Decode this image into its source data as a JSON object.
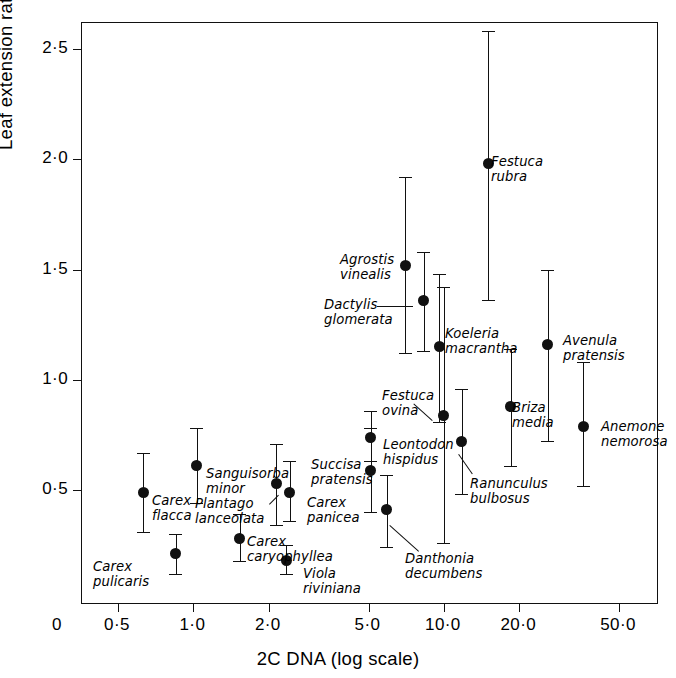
{
  "figure": {
    "x_axis_title": "2C DNA (log scale)",
    "y_axis_title_main": "Leaf extension rate (mm day",
    "y_axis_title_sup": "−1",
    "y_axis_title_tail": ")"
  },
  "chart_data": {
    "type": "scatter",
    "title": "",
    "xlabel": "2C DNA (log scale)",
    "ylabel": "Leaf extension rate (mm day⁻¹)",
    "x_scale": "log",
    "y_scale": "linear",
    "grid": false,
    "legend": "none",
    "xlim": [
      0.42,
      75.0
    ],
    "ylim": [
      0.0,
      2.62
    ],
    "x_ticklabels": [
      "0",
      "0·5",
      "1·0",
      "2·0",
      "5·0",
      "10·0",
      "20·0",
      "50·0"
    ],
    "x_tickvalues": [
      0,
      0.5,
      1.0,
      2.0,
      5.0,
      10.0,
      20.0,
      50.0
    ],
    "y_ticklabels": [
      "0·5",
      "1·0",
      "1·5",
      "2·0",
      "2·5"
    ],
    "y_tickvalues": [
      0.5,
      1.0,
      1.5,
      2.0,
      2.5
    ],
    "error_bars": "vertical, with caps",
    "points": [
      {
        "label": "Carex\nflacca",
        "x": 0.63,
        "y": 0.49,
        "ylow": 0.31,
        "yhigh": 0.67,
        "label_x": 151,
        "label_y": 493,
        "leader": false
      },
      {
        "label": "Carex\npulicaris",
        "x": 0.85,
        "y": 0.21,
        "ylow": 0.12,
        "yhigh": 0.3,
        "label_x": 92,
        "label_y": 559,
        "leader": false
      },
      {
        "label": "Sanguisorba\nminor",
        "x": 1.03,
        "y": 0.61,
        "ylow": 0.44,
        "yhigh": 0.78,
        "label_x": 205,
        "label_y": 466,
        "leader": false
      },
      {
        "label": "Carex\ncaryophyllea",
        "x": 1.53,
        "y": 0.28,
        "ylow": 0.18,
        "yhigh": 0.39,
        "label_x": 246,
        "label_y": 534,
        "leader": false
      },
      {
        "label": "Plantago\nlanceolata",
        "x": 2.14,
        "y": 0.53,
        "ylow": 0.34,
        "yhigh": 0.71,
        "label_x": 194,
        "label_y": 496,
        "leader": true,
        "leader_x1": 268,
        "leader_y1": 503,
        "leader_x2": 277,
        "leader_y2": 494
      },
      {
        "label": "Carex\npanicea",
        "x": 2.42,
        "y": 0.49,
        "ylow": 0.36,
        "yhigh": 0.63,
        "label_x": 306,
        "label_y": 495,
        "leader": false
      },
      {
        "label": "Viola\nriviniana",
        "x": 2.35,
        "y": 0.18,
        "ylow": 0.12,
        "yhigh": 0.25,
        "label_x": 302,
        "label_y": 566,
        "leader": false
      },
      {
        "label": "Succisa\npratensis",
        "x": 5.1,
        "y": 0.59,
        "ylow": 0.4,
        "yhigh": 0.78,
        "label_x": 310,
        "label_y": 457,
        "leader": false
      },
      {
        "label": "Leontodon\nhispidus",
        "x": 5.1,
        "y": 0.74,
        "ylow": 0.63,
        "yhigh": 0.86,
        "label_x": 382,
        "label_y": 437,
        "leader": false
      },
      {
        "label": "Danthonia\ndecumbens",
        "x": 5.9,
        "y": 0.41,
        "ylow": 0.24,
        "yhigh": 0.57,
        "label_x": 404,
        "label_y": 551,
        "leader": true,
        "leader_x1": 389,
        "leader_y1": 524,
        "leader_x2": 418,
        "leader_y2": 550
      },
      {
        "label": "Agrostis\nvinealis",
        "x": 7.0,
        "y": 1.52,
        "ylow": 1.12,
        "yhigh": 1.92,
        "label_x": 339,
        "label_y": 252,
        "leader": false
      },
      {
        "label": "Dactylis\nglomerata",
        "x": 8.3,
        "y": 1.36,
        "ylow": 1.13,
        "yhigh": 1.58,
        "label_x": 323,
        "label_y": 297,
        "leader": true,
        "leader_x1": 376,
        "leader_y1": 305,
        "leader_x2": 412,
        "leader_y2": 305
      },
      {
        "label": "Koeleria\nmacrantha",
        "x": 9.6,
        "y": 1.15,
        "ylow": 0.81,
        "yhigh": 1.48,
        "label_x": 444,
        "label_y": 326,
        "leader": false
      },
      {
        "label": "Festuca\novina",
        "x": 10.0,
        "y": 0.84,
        "ylow": 0.26,
        "yhigh": 1.42,
        "label_x": 381,
        "label_y": 388,
        "leader": true,
        "leader_x1": 431,
        "leader_y1": 420,
        "leader_x2": 412,
        "leader_y2": 403
      },
      {
        "label": "Ranunculus\nbulbosus",
        "x": 11.8,
        "y": 0.72,
        "ylow": 0.48,
        "yhigh": 0.96,
        "label_x": 469,
        "label_y": 476,
        "leader": true,
        "leader_x1": 458,
        "leader_y1": 453,
        "leader_x2": 472,
        "leader_y2": 473
      },
      {
        "label": "Festuca\nrubra",
        "x": 15.0,
        "y": 1.98,
        "ylow": 1.36,
        "yhigh": 2.58,
        "label_x": 490,
        "label_y": 154,
        "leader": false
      },
      {
        "label": "Briza\nmedia",
        "x": 18.5,
        "y": 0.88,
        "ylow": 0.61,
        "yhigh": 1.14,
        "label_x": 511,
        "label_y": 400,
        "leader": false
      },
      {
        "label": "Avenula\npratensis",
        "x": 26.0,
        "y": 1.16,
        "ylow": 0.72,
        "yhigh": 1.5,
        "label_x": 562,
        "label_y": 333,
        "leader": false
      },
      {
        "label": "Anemone\nnemorosa",
        "x": 36.0,
        "y": 0.79,
        "ylow": 0.52,
        "yhigh": 1.08,
        "label_x": 600,
        "label_y": 419,
        "leader": false
      }
    ]
  }
}
